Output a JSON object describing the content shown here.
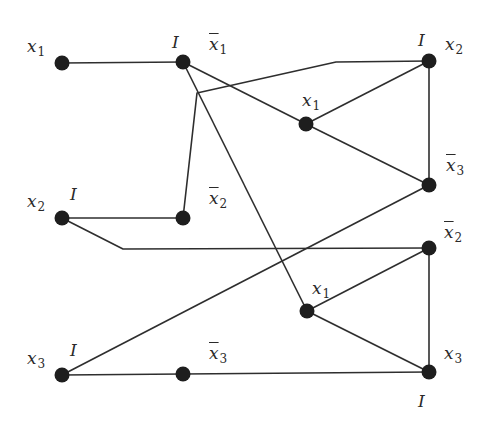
{
  "diagram": {
    "type": "graph",
    "stroke_color": "#2e2e2e",
    "node_color": "#1e1e1e",
    "nodes": [
      {
        "id": "A",
        "x": 62,
        "y": 63,
        "label": "x",
        "sub": "1",
        "neg": false,
        "lx": 27,
        "ly": 38,
        "extra": ""
      },
      {
        "id": "B",
        "x": 183,
        "y": 62,
        "label": "x",
        "sub": "1",
        "neg": true,
        "lx": 209,
        "ly": 36,
        "extra": "I",
        "ex": 172,
        "ey": 34
      },
      {
        "id": "C",
        "x": 306,
        "y": 124,
        "label": "x",
        "sub": "1",
        "neg": false,
        "lx": 302,
        "ly": 92,
        "extra": ""
      },
      {
        "id": "D",
        "x": 429,
        "y": 61,
        "label": "x",
        "sub": "2",
        "neg": false,
        "lx": 445,
        "ly": 36,
        "extra": "I",
        "ex": 418,
        "ey": 32
      },
      {
        "id": "E",
        "x": 429,
        "y": 185,
        "label": "x",
        "sub": "3",
        "neg": true,
        "lx": 446,
        "ly": 157,
        "extra": ""
      },
      {
        "id": "F",
        "x": 62,
        "y": 218,
        "label": "x",
        "sub": "2",
        "neg": false,
        "lx": 27,
        "ly": 193,
        "extra": "I",
        "ex": 70,
        "ey": 186
      },
      {
        "id": "G",
        "x": 183,
        "y": 218,
        "label": "x",
        "sub": "2",
        "neg": true,
        "lx": 209,
        "ly": 190,
        "extra": ""
      },
      {
        "id": "H",
        "x": 429,
        "y": 248,
        "label": "x",
        "sub": "2",
        "neg": true,
        "lx": 444,
        "ly": 224,
        "extra": ""
      },
      {
        "id": "J",
        "x": 307,
        "y": 311,
        "label": "x",
        "sub": "1",
        "neg": false,
        "lx": 312,
        "ly": 280,
        "extra": ""
      },
      {
        "id": "K",
        "x": 429,
        "y": 372,
        "label": "x",
        "sub": "3",
        "neg": false,
        "lx": 444,
        "ly": 345,
        "extra": "I",
        "ex": 418,
        "ey": 393
      },
      {
        "id": "L",
        "x": 62,
        "y": 375,
        "label": "x",
        "sub": "3",
        "neg": false,
        "lx": 27,
        "ly": 350,
        "extra": "I",
        "ex": 70,
        "ey": 342
      },
      {
        "id": "M",
        "x": 183,
        "y": 374,
        "label": "x",
        "sub": "3",
        "neg": true,
        "lx": 209,
        "ly": 345,
        "extra": ""
      }
    ],
    "edges": [
      {
        "from": "A",
        "to": "B",
        "points": [
          [
            62,
            63
          ],
          [
            183,
            62
          ]
        ]
      },
      {
        "from": "B",
        "to": "C",
        "points": [
          [
            183,
            62
          ],
          [
            306,
            124
          ]
        ]
      },
      {
        "from": "B",
        "to": "J",
        "points": [
          [
            183,
            62
          ],
          [
            307,
            311
          ]
        ]
      },
      {
        "from": "C",
        "to": "D",
        "points": [
          [
            306,
            124
          ],
          [
            429,
            61
          ]
        ]
      },
      {
        "from": "C",
        "to": "E",
        "points": [
          [
            306,
            124
          ],
          [
            429,
            185
          ]
        ]
      },
      {
        "from": "D",
        "to": "E",
        "points": [
          [
            429,
            61
          ],
          [
            429,
            185
          ]
        ]
      },
      {
        "from": "G",
        "to": "D",
        "points": [
          [
            183,
            218
          ],
          [
            197,
            93
          ],
          [
            336,
            62
          ],
          [
            429,
            61
          ]
        ]
      },
      {
        "from": "F",
        "to": "G",
        "points": [
          [
            62,
            218
          ],
          [
            183,
            218
          ]
        ]
      },
      {
        "from": "F",
        "to": "H",
        "points": [
          [
            62,
            218
          ],
          [
            123,
            249
          ],
          [
            429,
            248
          ]
        ]
      },
      {
        "from": "L",
        "to": "E",
        "points": [
          [
            62,
            375
          ],
          [
            429,
            185
          ]
        ]
      },
      {
        "from": "L",
        "to": "M",
        "points": [
          [
            62,
            375
          ],
          [
            183,
            374
          ]
        ]
      },
      {
        "from": "M",
        "to": "K",
        "points": [
          [
            183,
            374
          ],
          [
            429,
            372
          ]
        ]
      },
      {
        "from": "J",
        "to": "H",
        "points": [
          [
            307,
            311
          ],
          [
            429,
            248
          ]
        ]
      },
      {
        "from": "J",
        "to": "K",
        "points": [
          [
            307,
            311
          ],
          [
            429,
            372
          ]
        ]
      },
      {
        "from": "H",
        "to": "K",
        "points": [
          [
            429,
            248
          ],
          [
            429,
            372
          ]
        ]
      }
    ],
    "labels": {
      "A": {
        "var": "x",
        "sub": "1"
      },
      "B": {
        "var": "x",
        "sub": "1",
        "extra": "I"
      },
      "C": {
        "var": "x",
        "sub": "1"
      },
      "D": {
        "var": "x",
        "sub": "2",
        "extra": "I"
      },
      "E": {
        "var": "x",
        "sub": "3"
      },
      "F": {
        "var": "x",
        "sub": "2",
        "extra": "I"
      },
      "G": {
        "var": "x",
        "sub": "2"
      },
      "H": {
        "var": "x",
        "sub": "2"
      },
      "J": {
        "var": "x",
        "sub": "1"
      },
      "K": {
        "var": "x",
        "sub": "3",
        "extra": "I"
      },
      "L": {
        "var": "x",
        "sub": "3",
        "extra": "I"
      },
      "M": {
        "var": "x",
        "sub": "3"
      }
    }
  }
}
